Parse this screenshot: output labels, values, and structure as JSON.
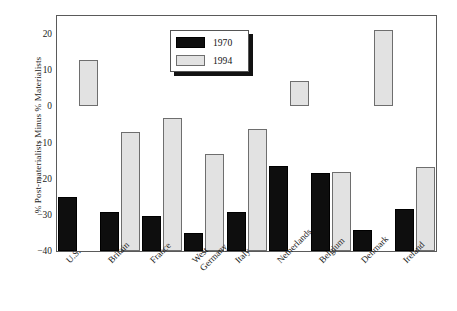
{
  "chart_data": {
    "type": "bar",
    "title": "",
    "xlabel": "",
    "ylabel": "% Post-materialists Minus % Materialists",
    "ylim": [
      -40,
      25
    ],
    "yticks": [
      20,
      10,
      0,
      -10,
      -20,
      -30,
      -40
    ],
    "ytick_labels": [
      "20",
      "10",
      "0",
      "−10",
      "−20",
      "−30",
      "−40"
    ],
    "grid": false,
    "legend_position": "top-center",
    "categories": [
      "U.S.",
      "Britain",
      "France",
      "West Germany",
      "Italy",
      "Netherlands",
      "Belgium",
      "Denmark",
      "Ireland"
    ],
    "category_lines": [
      [
        "U.S."
      ],
      [
        "Britain"
      ],
      [
        "France"
      ],
      [
        "West",
        "Germany"
      ],
      [
        "Italy"
      ],
      [
        "Netherlands"
      ],
      [
        "Belgium"
      ],
      [
        "Denmark"
      ],
      [
        "Ireland"
      ]
    ],
    "series": [
      {
        "name": "1970",
        "color": "#0e0e0e",
        "values": [
          -25.2,
          -29.1,
          -30.2,
          -35.1,
          -29.2,
          -16.5,
          -18.5,
          -34.2,
          -28.3
        ]
      },
      {
        "name": "1994",
        "color": "#e2e2e2",
        "values": [
          12.7,
          -7.2,
          -3.1,
          -13.2,
          -6.2,
          7.0,
          -18.1,
          21.0,
          -16.7
        ]
      }
    ]
  },
  "legend": {
    "items": [
      {
        "label": "1970",
        "swatch": "black-swatch"
      },
      {
        "label": "1994",
        "swatch": "light-gray-swatch"
      }
    ]
  },
  "axes": {
    "y_title": "% Post-materialists Minus % Materialists",
    "y_tick_labels": [
      "20",
      "10",
      "0",
      "−10",
      "−20",
      "−30",
      "−40"
    ]
  },
  "colors": {
    "series_1970": "#0e0e0e",
    "series_1994": "#e2e2e2",
    "frame": "#5a5a5a",
    "background": "#ffffff",
    "text": "#1a1a1a"
  }
}
